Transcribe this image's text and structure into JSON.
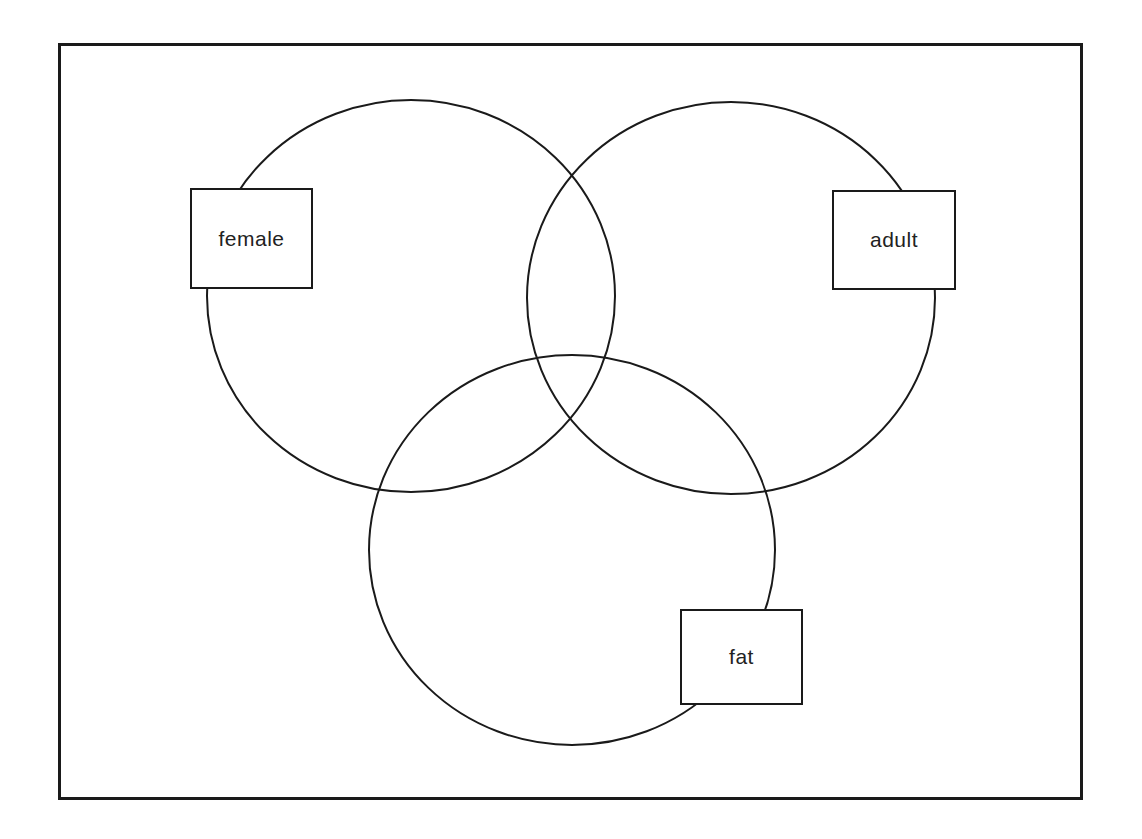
{
  "diagram": {
    "type": "venn",
    "sets": [
      {
        "id": "female",
        "label": "female"
      },
      {
        "id": "adult",
        "label": "adult"
      },
      {
        "id": "fat",
        "label": "fat"
      }
    ],
    "line_color": "#1a1a1a",
    "background": "#ffffff"
  }
}
